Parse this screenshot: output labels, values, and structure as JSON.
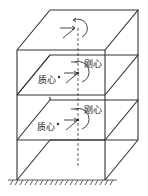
{
  "figure": {
    "title": "",
    "labels": {
      "center_of_rigidity": "刚心",
      "center_of_mass": "质心"
    },
    "floors": [
      {
        "name": "floor-3",
        "show_labels": false
      },
      {
        "name": "floor-2",
        "show_labels": true
      },
      {
        "name": "floor-1",
        "show_labels": true
      }
    ],
    "colors": {
      "line": "#333333",
      "background": "#ffffff"
    },
    "icons": [
      "torsion-arrow-icon",
      "force-arrow-icon",
      "ground-hatch-icon",
      "dashed-axis-icon"
    ]
  }
}
